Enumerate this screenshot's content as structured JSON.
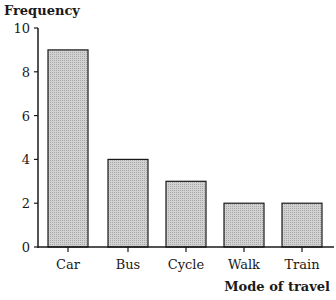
{
  "chart_data": {
    "type": "bar",
    "title": "",
    "xlabel": "Mode of travel",
    "ylabel": "Frequency",
    "categories": [
      "Car",
      "Bus",
      "Cycle",
      "Walk",
      "Train"
    ],
    "values": [
      9,
      4,
      3,
      2,
      2
    ],
    "ylim": [
      0,
      10
    ],
    "yticks": [
      0,
      2,
      4,
      6,
      8,
      10
    ],
    "grid": false,
    "legend": null,
    "bar_fill": "#c8c8c8",
    "bar_edge": "#1a1a1a"
  }
}
